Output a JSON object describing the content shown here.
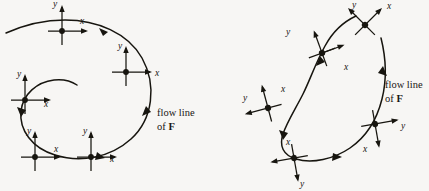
{
  "figure": {
    "background_color": "#f7f6f4",
    "ink_color": "#17150f",
    "panels": [
      {
        "id": "left-panel",
        "name": "non-rotating-frame-diagram",
        "description": "Spiral flow line with coordinate frames that stay axis aligned",
        "flow_label_line1": "flow line",
        "flow_label_line2_prefix": "of ",
        "flow_label_line2_field": "F",
        "frames": [
          {
            "id": "frame-1",
            "rotation_deg": 0,
            "x_axis_label": "x",
            "y_axis_label": "y"
          },
          {
            "id": "frame-2",
            "rotation_deg": 0,
            "x_axis_label": "x",
            "y_axis_label": "y"
          },
          {
            "id": "frame-3",
            "rotation_deg": 0,
            "x_axis_label": "x",
            "y_axis_label": "y"
          },
          {
            "id": "frame-4",
            "rotation_deg": 0,
            "x_axis_label": "x",
            "y_axis_label": "y"
          },
          {
            "id": "frame-5",
            "rotation_deg": 0,
            "x_axis_label": "x",
            "y_axis_label": "y"
          }
        ]
      },
      {
        "id": "right-panel",
        "name": "rotating-frame-diagram",
        "description": "Open C shaped flow line with coordinate frames that rotate along the curve",
        "flow_label_line1": "flow line",
        "flow_label_line2_prefix": "of ",
        "flow_label_line2_field": "F",
        "frames": [
          {
            "id": "frame-1",
            "rotation_deg": 45,
            "x_axis_label": "x",
            "y_axis_label": "y"
          },
          {
            "id": "frame-2",
            "rotation_deg": 20,
            "x_axis_label": "x",
            "y_axis_label": "y"
          },
          {
            "id": "frame-3",
            "rotation_deg": 90,
            "x_axis_label": "x",
            "y_axis_label": "y"
          },
          {
            "id": "frame-4",
            "rotation_deg": 180,
            "x_axis_label": "x",
            "y_axis_label": "y"
          },
          {
            "id": "frame-5",
            "rotation_deg": 270,
            "x_axis_label": "x",
            "y_axis_label": "y"
          }
        ]
      }
    ]
  }
}
